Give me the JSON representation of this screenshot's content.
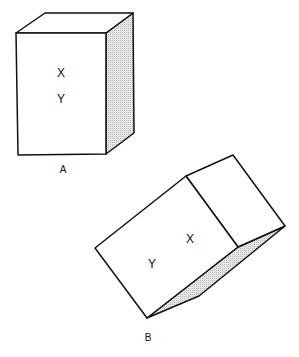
{
  "figure": {
    "box_a": {
      "label": "A",
      "face_labels": [
        "X",
        "Y"
      ]
    },
    "box_b": {
      "label": "B",
      "face_labels": [
        "Y",
        "X"
      ]
    },
    "colors": {
      "stroke": "#111111",
      "shade": "#d9d9d9",
      "background": "#ffffff"
    }
  }
}
